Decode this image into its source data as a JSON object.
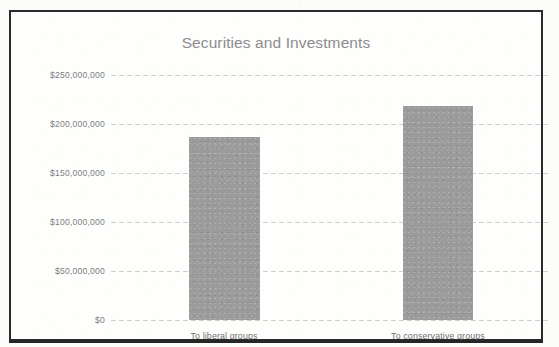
{
  "chart_data": {
    "type": "bar",
    "title": "Securities and Investments",
    "xlabel": "",
    "ylabel": "",
    "categories": [
      "To liberal groups",
      "To conservative groups"
    ],
    "values": [
      187000000,
      218000000
    ],
    "value_labels": [
      "$187,000,000",
      "$218,000,000"
    ],
    "ylim": [
      0,
      250000000
    ],
    "ytick_values": [
      250000000,
      200000000,
      150000000,
      100000000,
      50000000,
      0
    ],
    "ytick_labels": [
      "$250,000,000",
      "$200,000,000",
      "$150,000,000",
      "$100,000,000",
      "$50,000,000",
      "$0"
    ],
    "grid": true,
    "grid_style": "dashed-horizontal",
    "legend": false,
    "legend_position": "none",
    "colors": {
      "bar_fill": "#9b9b9b",
      "title_text": "#8c8c8c",
      "tick_text": "#7d7d7d",
      "gridline": "#cfcfcf",
      "frame_border": "#2b2b2b",
      "background": "#fcfcfb"
    }
  }
}
